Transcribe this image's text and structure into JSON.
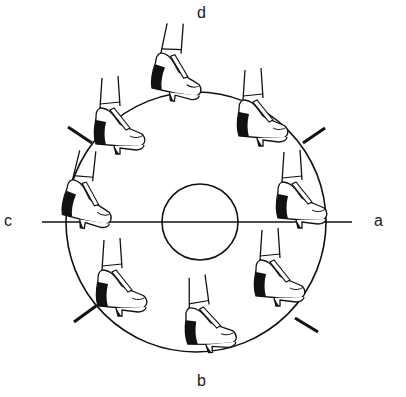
{
  "diagram": {
    "type": "rotation-diagram",
    "labels": {
      "top": "d",
      "bottom": "b",
      "left": "c",
      "right": "a"
    },
    "colors": {
      "stroke": "#111111",
      "fill_dark": "#111111",
      "background": "#ffffff"
    },
    "outer_circle": {
      "cx": 196,
      "cy": 222,
      "r": 130
    },
    "inner_circle": {
      "cx": 200,
      "cy": 222,
      "r": 38
    },
    "axis_line": {
      "x1": 42,
      "x2": 352,
      "y": 222
    },
    "shoes": [
      {
        "id": "top",
        "x": 165,
        "y": 70
      },
      {
        "id": "upper-left",
        "x": 103,
        "y": 128
      },
      {
        "id": "upper-right",
        "x": 255,
        "y": 118
      },
      {
        "id": "left",
        "x": 70,
        "y": 205
      },
      {
        "id": "right",
        "x": 290,
        "y": 210
      },
      {
        "id": "lower-left",
        "x": 103,
        "y": 290
      },
      {
        "id": "bottom",
        "x": 200,
        "y": 328
      },
      {
        "id": "lower-right",
        "x": 265,
        "y": 285
      }
    ],
    "tick_marks": [
      {
        "id": "upper-left",
        "x1": 68,
        "y1": 127,
        "x2": 92,
        "y2": 143
      },
      {
        "id": "upper-right",
        "x1": 303,
        "y1": 143,
        "x2": 325,
        "y2": 128
      },
      {
        "id": "lower-left",
        "x1": 74,
        "y1": 322,
        "x2": 96,
        "y2": 306
      },
      {
        "id": "lower-right",
        "x1": 295,
        "y1": 318,
        "x2": 318,
        "y2": 332
      }
    ]
  }
}
